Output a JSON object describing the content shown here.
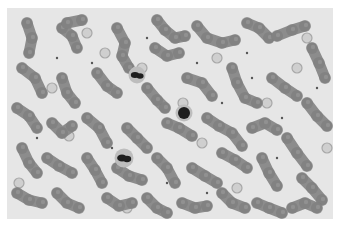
{
  "image": {
    "subject": "blood smear micrograph (grayscale)",
    "colors": {
      "background": "#e6e6e6",
      "page": "#ffffff",
      "rbc": "#8c8c8c",
      "rbc_dark": "#7a7a7a",
      "wbc": "#1e1e1e",
      "pale_cell": "#cfcfcf"
    },
    "rbc_chains": [
      [
        [
          20,
          15
        ],
        [
          25,
          30
        ],
        [
          22,
          45
        ]
      ],
      [
        [
          55,
          20
        ],
        [
          65,
          28
        ],
        [
          70,
          40
        ]
      ],
      [
        [
          60,
          15
        ],
        [
          75,
          12
        ]
      ],
      [
        [
          110,
          20
        ],
        [
          118,
          35
        ],
        [
          115,
          48
        ],
        [
          122,
          60
        ]
      ],
      [
        [
          150,
          12
        ],
        [
          158,
          22
        ],
        [
          168,
          30
        ],
        [
          178,
          28
        ]
      ],
      [
        [
          148,
          40
        ],
        [
          160,
          48
        ],
        [
          172,
          45
        ]
      ],
      [
        [
          190,
          18
        ],
        [
          200,
          30
        ],
        [
          215,
          35
        ],
        [
          228,
          32
        ]
      ],
      [
        [
          240,
          15
        ],
        [
          252,
          20
        ],
        [
          262,
          30
        ]
      ],
      [
        [
          270,
          28
        ],
        [
          285,
          22
        ],
        [
          298,
          18
        ]
      ],
      [
        [
          305,
          40
        ],
        [
          312,
          55
        ],
        [
          318,
          70
        ]
      ],
      [
        [
          15,
          60
        ],
        [
          28,
          70
        ],
        [
          35,
          85
        ]
      ],
      [
        [
          55,
          70
        ],
        [
          60,
          85
        ],
        [
          68,
          95
        ]
      ],
      [
        [
          90,
          65
        ],
        [
          100,
          78
        ],
        [
          110,
          85
        ]
      ],
      [
        [
          140,
          80
        ],
        [
          150,
          92
        ],
        [
          158,
          100
        ]
      ],
      [
        [
          180,
          70
        ],
        [
          195,
          75
        ],
        [
          205,
          88
        ]
      ],
      [
        [
          225,
          60
        ],
        [
          230,
          75
        ],
        [
          238,
          90
        ],
        [
          250,
          95
        ]
      ],
      [
        [
          265,
          70
        ],
        [
          278,
          80
        ],
        [
          290,
          88
        ]
      ],
      [
        [
          300,
          95
        ],
        [
          310,
          108
        ],
        [
          320,
          118
        ]
      ],
      [
        [
          10,
          100
        ],
        [
          22,
          108
        ],
        [
          30,
          120
        ]
      ],
      [
        [
          45,
          115
        ],
        [
          55,
          125
        ],
        [
          65,
          118
        ]
      ],
      [
        [
          80,
          110
        ],
        [
          92,
          120
        ],
        [
          100,
          135
        ]
      ],
      [
        [
          120,
          120
        ],
        [
          130,
          130
        ],
        [
          140,
          140
        ]
      ],
      [
        [
          160,
          115
        ],
        [
          172,
          120
        ],
        [
          185,
          128
        ]
      ],
      [
        [
          200,
          110
        ],
        [
          212,
          118
        ],
        [
          225,
          125
        ],
        [
          235,
          138
        ]
      ],
      [
        [
          245,
          120
        ],
        [
          258,
          115
        ],
        [
          270,
          122
        ]
      ],
      [
        [
          280,
          130
        ],
        [
          290,
          145
        ],
        [
          300,
          158
        ]
      ],
      [
        [
          15,
          140
        ],
        [
          22,
          155
        ],
        [
          30,
          165
        ]
      ],
      [
        [
          40,
          150
        ],
        [
          52,
          158
        ],
        [
          65,
          165
        ]
      ],
      [
        [
          80,
          150
        ],
        [
          88,
          162
        ],
        [
          95,
          175
        ]
      ],
      [
        [
          110,
          160
        ],
        [
          122,
          168
        ],
        [
          135,
          172
        ]
      ],
      [
        [
          150,
          150
        ],
        [
          160,
          160
        ],
        [
          168,
          175
        ]
      ],
      [
        [
          185,
          160
        ],
        [
          198,
          168
        ],
        [
          210,
          175
        ]
      ],
      [
        [
          215,
          145
        ],
        [
          228,
          152
        ],
        [
          240,
          160
        ]
      ],
      [
        [
          255,
          150
        ],
        [
          262,
          165
        ],
        [
          270,
          178
        ]
      ],
      [
        [
          295,
          170
        ],
        [
          305,
          180
        ],
        [
          315,
          192
        ]
      ],
      [
        [
          10,
          185
        ],
        [
          22,
          192
        ],
        [
          35,
          195
        ]
      ],
      [
        [
          50,
          185
        ],
        [
          60,
          195
        ],
        [
          72,
          200
        ]
      ],
      [
        [
          100,
          190
        ],
        [
          112,
          198
        ],
        [
          125,
          195
        ]
      ],
      [
        [
          140,
          190
        ],
        [
          150,
          200
        ],
        [
          160,
          205
        ]
      ],
      [
        [
          175,
          195
        ],
        [
          188,
          200
        ],
        [
          200,
          198
        ]
      ],
      [
        [
          215,
          185
        ],
        [
          225,
          195
        ],
        [
          238,
          200
        ]
      ],
      [
        [
          250,
          195
        ],
        [
          262,
          200
        ],
        [
          275,
          205
        ]
      ],
      [
        [
          285,
          200
        ],
        [
          298,
          195
        ],
        [
          310,
          200
        ]
      ]
    ],
    "pale_cells": [
      [
        80,
        25
      ],
      [
        98,
        45
      ],
      [
        45,
        80
      ],
      [
        135,
        60
      ],
      [
        62,
        128
      ],
      [
        176,
        95
      ],
      [
        210,
        50
      ],
      [
        260,
        95
      ],
      [
        290,
        60
      ],
      [
        320,
        140
      ],
      [
        195,
        135
      ],
      [
        230,
        180
      ],
      [
        120,
        200
      ],
      [
        12,
        175
      ],
      [
        300,
        30
      ]
    ],
    "dark_cells": [
      {
        "x": 130,
        "y": 67,
        "r": 6,
        "type": "granulocyte"
      },
      {
        "x": 177,
        "y": 105,
        "r": 6,
        "type": "lymphocyte"
      },
      {
        "x": 117,
        "y": 150,
        "r": 7,
        "type": "granulocyte"
      }
    ],
    "platelets": [
      [
        50,
        50
      ],
      [
        85,
        55
      ],
      [
        140,
        30
      ],
      [
        190,
        55
      ],
      [
        240,
        45
      ],
      [
        275,
        110
      ],
      [
        215,
        95
      ],
      [
        105,
        140
      ],
      [
        160,
        175
      ],
      [
        270,
        150
      ],
      [
        30,
        130
      ],
      [
        200,
        185
      ],
      [
        245,
        70
      ],
      [
        310,
        80
      ]
    ]
  }
}
